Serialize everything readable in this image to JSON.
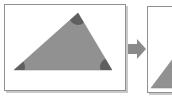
{
  "figure": {
    "background_color": "#ffffff",
    "width": 172,
    "height": 100
  },
  "colors": {
    "panel_border": "#8f8f8f",
    "panel_shadow": "#c9c9c9",
    "panel_fill": "#ffffff",
    "shape_fill": "#919191",
    "shape_outline": "#8a8a8a",
    "corner_marker": "#5f5f5f",
    "arrow_fill": "#8a8a8a"
  },
  "panels": [
    {
      "id": "before",
      "name": "before-panel",
      "label": "",
      "shape": {
        "type": "triangle",
        "name": "gray-triangle",
        "vertices": [
          {
            "name": "apex",
            "x": 74,
            "y": 9
          },
          {
            "name": "bottom-left",
            "x": 10,
            "y": 66
          },
          {
            "name": "bottom-right",
            "x": 108,
            "y": 66
          }
        ],
        "corner_markers": [
          {
            "name": "corner-marker-apex",
            "x": 74,
            "y": 9,
            "size": 13
          },
          {
            "name": "corner-marker-bottom-left",
            "x": 10,
            "y": 66,
            "size": 11
          },
          {
            "name": "corner-marker-bottom-right",
            "x": 108,
            "y": 66,
            "size": 13
          }
        ]
      }
    },
    {
      "id": "after",
      "name": "after-panel",
      "label": "",
      "shape": {
        "type": "triangle",
        "name": "gray-triangle-cropped",
        "vertices": [
          {
            "name": "apex",
            "x": 40,
            "y": 34
          },
          {
            "name": "bottom-left",
            "x": 4,
            "y": 82
          },
          {
            "name": "bottom-right",
            "x": 62,
            "y": 82
          }
        ],
        "corner_markers": [
          {
            "name": "corner-marker-apex",
            "x": 40,
            "y": 34,
            "size": 11
          }
        ]
      }
    }
  ],
  "arrow": {
    "name": "right-arrow",
    "direction": "right",
    "label": ""
  }
}
